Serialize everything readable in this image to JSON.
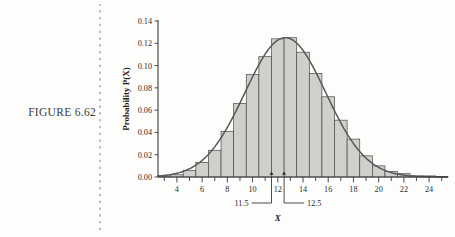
{
  "figure": {
    "label": "FIGURE 6.62"
  },
  "chart_data": {
    "type": "bar",
    "title": "",
    "subtitle": "",
    "xlabel": "X",
    "ylabel": "Probability P(X)",
    "xlim": [
      2.5,
      25.5
    ],
    "ylim": [
      0.0,
      0.14
    ],
    "grid": false,
    "legend": null,
    "x_major_ticks": [
      4,
      6,
      8,
      10,
      12,
      14,
      16,
      18,
      20,
      22,
      24
    ],
    "x_major_tick_labels": [
      "4",
      "6",
      "8",
      "10",
      "12",
      "14",
      "16",
      "18",
      "20",
      "22",
      "24"
    ],
    "x_minor_ticks": [
      3,
      5,
      7,
      9,
      11,
      13,
      15,
      17,
      19,
      21,
      23,
      25
    ],
    "y_ticks": [
      0.0,
      0.02,
      0.04,
      0.06,
      0.08,
      0.1,
      0.12,
      0.14
    ],
    "y_tick_labels": [
      "0.00",
      "0.02",
      "0.04",
      "0.06",
      "0.08",
      "0.10",
      "0.12",
      "0.14"
    ],
    "categories": [
      3,
      4,
      5,
      6,
      7,
      8,
      9,
      10,
      11,
      12,
      13,
      14,
      15,
      16,
      17,
      18,
      19,
      20,
      21,
      22,
      23,
      24,
      25
    ],
    "values": [
      0.001,
      0.002,
      0.006,
      0.013,
      0.024,
      0.041,
      0.066,
      0.092,
      0.108,
      0.124,
      0.125,
      0.112,
      0.093,
      0.072,
      0.051,
      0.034,
      0.019,
      0.01,
      0.005,
      0.003,
      0.001,
      0.001,
      0.0005
    ],
    "bar_width": 1.0,
    "bar_fill": "#cfcfcb",
    "bar_edge": "#4a4a4a",
    "overlay_curve": {
      "name": "normal approximation",
      "type": "line",
      "color": "#58585a",
      "mean": 12.6,
      "sigma": 3.2,
      "peak": 0.125
    },
    "annotations": [
      {
        "label": "11.5",
        "x": 11.5,
        "marker": "tick-arrow"
      },
      {
        "label": "12.5",
        "x": 12.5,
        "marker": "tick-arrow"
      }
    ]
  }
}
